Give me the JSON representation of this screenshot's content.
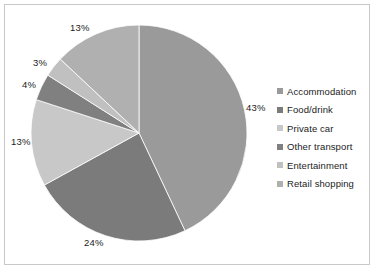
{
  "chart_data": {
    "type": "pie",
    "title": "",
    "subtitle": "",
    "xlabel": "",
    "ylabel": "",
    "legend_position": "right",
    "grid": false,
    "start_angle_deg": 0,
    "direction": "clockwise",
    "categories": [
      "Accommodation",
      "Food/drink",
      "Private car",
      "Other transport",
      "Entertainment",
      "Retail shopping"
    ],
    "values": [
      43,
      24,
      13,
      4,
      3,
      13
    ],
    "data_labels": [
      "43%",
      "24%",
      "13%",
      "4%",
      "3%",
      "13%"
    ],
    "colors": [
      "#9a9a9a",
      "#7b7b7b",
      "#c8c8c8",
      "#808080",
      "#c0c0c0",
      "#b0b0b0"
    ],
    "slices": [
      {
        "label": "Accommodation",
        "value": 43,
        "data_label": "43%",
        "color": "#9a9a9a"
      },
      {
        "label": "Food/drink",
        "value": 24,
        "data_label": "24%",
        "color": "#7b7b7b"
      },
      {
        "label": "Private car",
        "value": 13,
        "data_label": "13%",
        "color": "#c8c8c8"
      },
      {
        "label": "Other transport",
        "value": 4,
        "data_label": "4%",
        "color": "#808080"
      },
      {
        "label": "Entertainment",
        "value": 3,
        "data_label": "3%",
        "color": "#c0c0c0"
      },
      {
        "label": "Retail shopping",
        "value": 13,
        "data_label": "13%",
        "color": "#b0b0b0"
      }
    ]
  },
  "labels": {
    "accommodation_pct": "43%",
    "food_drink_pct": "24%",
    "private_car_pct": "13%",
    "other_transport_pct": "4%",
    "entertainment_pct": "3%",
    "retail_shopping_pct": "13%"
  },
  "legend": {
    "items": [
      {
        "label": "Accommodation"
      },
      {
        "label": "Food/drink"
      },
      {
        "label": "Private car"
      },
      {
        "label": "Other transport"
      },
      {
        "label": "Entertainment"
      },
      {
        "label": "Retail shopping"
      }
    ]
  },
  "style": {
    "border_color": "#c9c9c9",
    "background": "#ffffff",
    "text_color": "#1c1c1c"
  }
}
